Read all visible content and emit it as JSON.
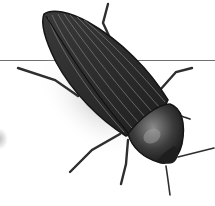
{
  "image": {
    "subject": "beetle",
    "description": "Grayscale photograph of an elongated ribbed beetle viewed from above at a diagonal, with a thin horizontal line crossing behind it",
    "colors": {
      "background": "#ffffff",
      "body_dark": "#2a2a2a",
      "body_mid": "#4a4a4a",
      "ridge": "#7a7a7a",
      "line": "#6e6e6e",
      "shadow": "#d8d8d8"
    }
  }
}
